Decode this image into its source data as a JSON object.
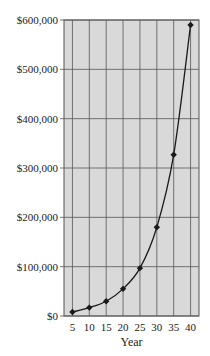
{
  "chart_data": {
    "type": "line",
    "title": "",
    "xlabel": "Year",
    "ylabel": "",
    "x": [
      5,
      10,
      15,
      20,
      25,
      30,
      35,
      40
    ],
    "series": [
      {
        "name": "Value",
        "values": [
          8000,
          17000,
          30000,
          55000,
          97000,
          180000,
          327000,
          590000
        ]
      }
    ],
    "x_tick_labels": [
      "5",
      "10",
      "15",
      "20",
      "25",
      "30",
      "35",
      "40"
    ],
    "y_tick_labels": [
      "$0",
      "$100,000",
      "$200,000",
      "$300,000",
      "$400,000",
      "$500,000",
      "$600,000"
    ],
    "y_ticks": [
      0,
      100000,
      200000,
      300000,
      400000,
      500000,
      600000
    ],
    "ylim": [
      0,
      600000
    ],
    "xlim": [
      2.5,
      42.5
    ],
    "grid": true,
    "marker": "diamond",
    "colors": {
      "plot_bg": "#d9d9d9",
      "grid": "#555555",
      "line": "#1a1a1a"
    }
  }
}
